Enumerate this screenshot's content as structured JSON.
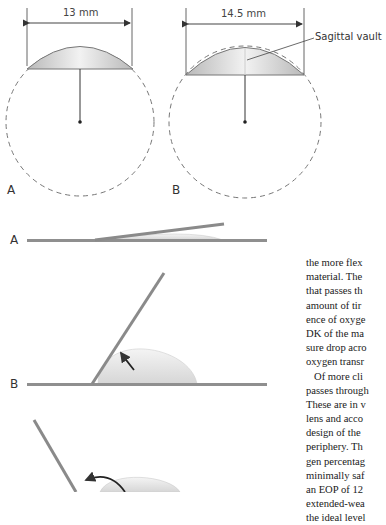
{
  "figure_top": {
    "panel_a": {
      "label": "A",
      "dimension": "13  mm"
    },
    "panel_b": {
      "label": "B",
      "dimension": "14.5  mm",
      "callout": "Sagittal vault"
    }
  },
  "figure_bottom": {
    "panels": [
      {
        "label": "A"
      },
      {
        "label": "B"
      },
      {
        "label": ""
      }
    ]
  },
  "body_text": {
    "lines": [
      "the more flex",
      "material. The",
      "that passes th",
      "amount of tir",
      "ence of oxyge",
      "DK of the ma",
      "sure drop acro",
      "oxygen transr",
      "Of more cli",
      "passes through",
      "These are in v",
      "lens and acco",
      "design of the",
      "periphery. Th",
      "gen percentag",
      "minimally saf",
      "an EOP of 12",
      "extended-wea",
      "the ideal level"
    ]
  }
}
